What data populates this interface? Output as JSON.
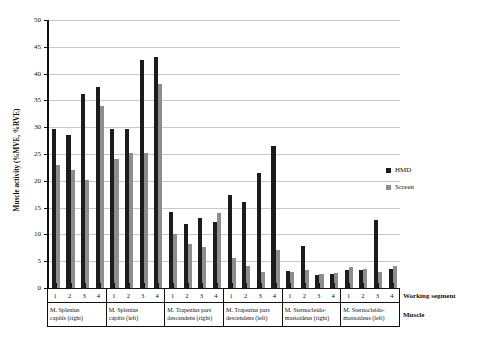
{
  "chart_data": {
    "type": "bar",
    "title": "",
    "xlabel": "Working segment",
    "ylabel": "Muscle activity (%MVE, %RVE)",
    "ylim": [
      0,
      50
    ],
    "yticks": [
      0,
      5,
      10,
      15,
      20,
      25,
      30,
      35,
      40,
      45,
      50
    ],
    "grid": true,
    "legend_position": "right",
    "row_headers": {
      "segment": "Working segment",
      "muscle": "Muscle"
    },
    "segments": [
      "1",
      "2",
      "3",
      "4"
    ],
    "categories": [
      "M. Splenius capitis (right)",
      "M. Splenius capitis (left)",
      "M. Trapezius pars descendens (right)",
      "M. Trapezius pars descendens (left)",
      "M. Sternocleido-mastoideus (right)",
      "M. Sternocleido-mastoideus (left)"
    ],
    "category_lines": [
      [
        "M. Splenius",
        "capitis (right)"
      ],
      [
        "M. Splenius",
        "capitis (left)"
      ],
      [
        "M. Trapezius pars",
        "descendens (right)"
      ],
      [
        "M. Trapezius pars",
        "descendens (left)"
      ],
      [
        "M. Sternocleido-",
        "mastoideus (right)"
      ],
      [
        "M. Sternocleido-",
        "mastoideus (left)"
      ]
    ],
    "series": [
      {
        "name": "HMD",
        "color": "#1c1c1c",
        "values": [
          [
            29.7,
            28.5,
            36.2,
            37.5
          ],
          [
            29.7,
            29.7,
            42.6,
            43.1
          ],
          [
            14.1,
            12.0,
            13.0,
            12.3
          ],
          [
            17.3,
            16.0,
            21.4,
            26.5
          ],
          [
            3.2,
            7.9,
            2.4,
            2.6
          ],
          [
            3.4,
            3.3,
            12.7,
            3.6
          ]
        ]
      },
      {
        "name": "Screen",
        "color": "#8d8d8d",
        "values": [
          [
            23.0,
            22.1,
            20.1,
            34.0
          ],
          [
            24.1,
            25.2,
            25.2,
            38.0
          ],
          [
            10.0,
            8.2,
            7.7,
            14.0
          ],
          [
            5.6,
            4.1,
            3.0,
            7.0
          ],
          [
            3.0,
            3.4,
            2.6,
            2.8
          ],
          [
            4.0,
            3.5,
            2.9,
            4.1
          ]
        ]
      }
    ]
  }
}
